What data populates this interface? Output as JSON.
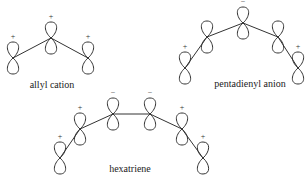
{
  "diagram": {
    "molecules": [
      {
        "name": "allyl cation",
        "label_pos": [
          52,
          88
        ],
        "orbitals": [
          {
            "x": 13,
            "y": 58,
            "sign": "+"
          },
          {
            "x": 51,
            "y": 38,
            "sign": "+"
          },
          {
            "x": 88,
            "y": 58,
            "sign": "+"
          }
        ]
      },
      {
        "name": "pentadienyl anion",
        "label_pos": [
          250,
          87
        ],
        "orbitals": [
          {
            "x": 185,
            "y": 68,
            "sign": "+"
          },
          {
            "x": 207,
            "y": 37,
            "sign": ""
          },
          {
            "x": 243,
            "y": 23,
            "sign": "−"
          },
          {
            "x": 278,
            "y": 37,
            "sign": ""
          },
          {
            "x": 298,
            "y": 68,
            "sign": "+"
          }
        ]
      },
      {
        "name": "hexatriene",
        "label_pos": [
          130,
          172
        ],
        "orbitals": [
          {
            "x": 60,
            "y": 158,
            "sign": "+"
          },
          {
            "x": 80,
            "y": 129,
            "sign": "+"
          },
          {
            "x": 113,
            "y": 114,
            "sign": "−"
          },
          {
            "x": 150,
            "y": 114,
            "sign": "−"
          },
          {
            "x": 182,
            "y": 129,
            "sign": "+"
          },
          {
            "x": 203,
            "y": 158,
            "sign": "+"
          }
        ]
      }
    ]
  }
}
